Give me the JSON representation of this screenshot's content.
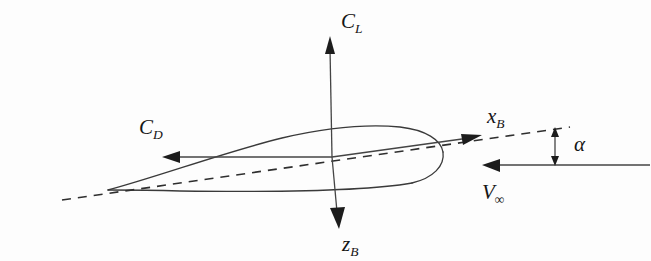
{
  "figure": {
    "type": "aerodynamics-force-diagram",
    "background_color": "#fdfdfd",
    "ink_color": "#1c1c1c"
  },
  "labels": {
    "lift_coefficient": {
      "base": "C",
      "sub": "L",
      "text": "CL",
      "x": 352,
      "y": 28
    },
    "drag_coefficient": {
      "base": "C",
      "sub": "D",
      "text": "CD",
      "x": 150,
      "y": 134
    },
    "body_x_axis": {
      "base": "x",
      "sub": "B",
      "text": "xB",
      "x": 494,
      "y": 123
    },
    "body_z_axis": {
      "base": "z",
      "sub": "B",
      "text": "zB",
      "x": 349,
      "y": 251
    },
    "freestream_velocity": {
      "base": "V",
      "sub": "∞",
      "text": "V∞",
      "x": 489,
      "y": 199
    },
    "angle_of_attack": {
      "text": "α",
      "x": 578,
      "y": 151
    }
  },
  "geometry": {
    "origin": {
      "x": 332,
      "y": 157
    },
    "leading_edge": {
      "x": 108,
      "y": 190
    },
    "trailing_edge": {
      "x": 443,
      "y": 156
    },
    "chord_line": {
      "x1": 62,
      "y1": 200,
      "x2": 570,
      "y2": 127
    },
    "chord_angle_deg": -8.2,
    "freestream_line": {
      "x1": 483,
      "y1": 165,
      "x2": 650,
      "y2": 165
    },
    "alpha_indicator": {
      "x": 555,
      "y_top": 128,
      "y_bottom": 165
    }
  },
  "vectors": [
    {
      "name": "lift",
      "label": "CL",
      "from": {
        "x": 332,
        "y": 157
      },
      "to": {
        "x": 330,
        "y": 38
      },
      "direction": "up"
    },
    {
      "name": "drag",
      "label": "CD",
      "from": {
        "x": 332,
        "y": 157
      },
      "to": {
        "x": 163,
        "y": 157
      },
      "direction": "left"
    },
    {
      "name": "body-x",
      "label": "xB",
      "from": {
        "x": 332,
        "y": 157
      },
      "to": {
        "x": 481,
        "y": 136
      },
      "direction": "right-up"
    },
    {
      "name": "body-z",
      "label": "zB",
      "from": {
        "x": 332,
        "y": 157
      },
      "to": {
        "x": 338,
        "y": 228
      },
      "direction": "down"
    },
    {
      "name": "freestream",
      "label": "V∞",
      "from": {
        "x": 650,
        "y": 165
      },
      "to": {
        "x": 483,
        "y": 165
      },
      "direction": "left"
    }
  ]
}
